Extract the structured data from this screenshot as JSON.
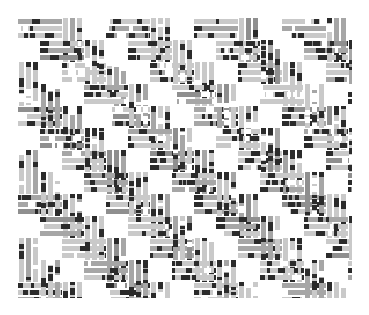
{
  "image": {
    "width": 369,
    "height": 315,
    "background_color": "#ffffff",
    "title": "basket weave textile pattern"
  },
  "figure": {
    "name": "basket-weave-pattern",
    "x": 18,
    "y": 18,
    "width": 334,
    "height": 280
  },
  "palette": {
    "background": "#ffffff",
    "gap": "#ffffff",
    "light_grey": "#c9c9c9",
    "mid_grey": "#a6a6a6",
    "dark_grey": "#8f8f8f",
    "black": "#2b2b2b",
    "edge": "#d8d8d8"
  },
  "weave": {
    "tile_size": 44,
    "half_tile": 22,
    "slat_count_x": 8,
    "slat_count_y": 7,
    "strip_thickness": 5,
    "strip_gap": 2,
    "strips_per_slat": 3,
    "dark_block_ratio": 0.32,
    "orientation_rule": "checkerboard: (col+row) even -> horizontal slat, odd -> vertical slat"
  },
  "chart_data": {
    "type": "heatmap",
    "title": "",
    "xlabel": "",
    "ylabel": "",
    "grid": false,
    "legend": null,
    "cell_size": 22,
    "cols": 16,
    "rows": 13,
    "note": "Each cell is a half-tile of the basket weave; value encodes slat orientation and tone",
    "tones": [
      "#ffffff",
      "#c9c9c9",
      "#a6a6a6",
      "#8f8f8f",
      "#2b2b2b"
    ],
    "orientation_matrix": [
      [
        "H",
        "H",
        "V",
        "V",
        "H",
        "H",
        "V",
        "V",
        "H",
        "H",
        "V",
        "V",
        "H",
        "H",
        "V",
        "V"
      ],
      [
        "H",
        "H",
        "V",
        "V",
        "H",
        "H",
        "V",
        "V",
        "H",
        "H",
        "V",
        "V",
        "H",
        "H",
        "V",
        "V"
      ],
      [
        "V",
        "V",
        "H",
        "H",
        "V",
        "V",
        "H",
        "H",
        "V",
        "V",
        "H",
        "H",
        "V",
        "V",
        "H",
        "H"
      ],
      [
        "V",
        "V",
        "H",
        "H",
        "V",
        "V",
        "H",
        "H",
        "V",
        "V",
        "H",
        "H",
        "V",
        "V",
        "H",
        "H"
      ],
      [
        "H",
        "H",
        "V",
        "V",
        "H",
        "H",
        "V",
        "V",
        "H",
        "H",
        "V",
        "V",
        "H",
        "H",
        "V",
        "V"
      ],
      [
        "H",
        "H",
        "V",
        "V",
        "H",
        "H",
        "V",
        "V",
        "H",
        "H",
        "V",
        "V",
        "H",
        "H",
        "V",
        "V"
      ],
      [
        "V",
        "V",
        "H",
        "H",
        "V",
        "V",
        "H",
        "H",
        "V",
        "V",
        "H",
        "H",
        "V",
        "V",
        "H",
        "H"
      ],
      [
        "V",
        "V",
        "H",
        "H",
        "V",
        "V",
        "H",
        "H",
        "V",
        "V",
        "H",
        "H",
        "V",
        "V",
        "H",
        "H"
      ],
      [
        "H",
        "H",
        "V",
        "V",
        "H",
        "H",
        "V",
        "V",
        "H",
        "H",
        "V",
        "V",
        "H",
        "H",
        "V",
        "V"
      ],
      [
        "H",
        "H",
        "V",
        "V",
        "H",
        "H",
        "V",
        "V",
        "H",
        "H",
        "V",
        "V",
        "H",
        "H",
        "V",
        "V"
      ],
      [
        "V",
        "V",
        "H",
        "H",
        "V",
        "V",
        "H",
        "H",
        "V",
        "V",
        "H",
        "H",
        "V",
        "V",
        "H",
        "H"
      ],
      [
        "V",
        "V",
        "H",
        "H",
        "V",
        "V",
        "H",
        "H",
        "V",
        "V",
        "H",
        "H",
        "V",
        "V",
        "H",
        "H"
      ],
      [
        "H",
        "H",
        "V",
        "V",
        "H",
        "H",
        "V",
        "V",
        "H",
        "H",
        "V",
        "V",
        "H",
        "H",
        "V",
        "V"
      ]
    ]
  }
}
